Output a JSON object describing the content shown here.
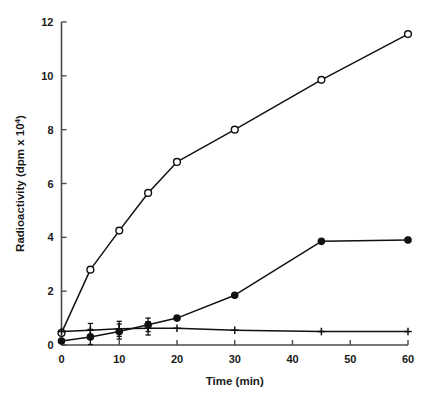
{
  "chart_data": {
    "type": "line",
    "title": "",
    "xlabel": "Time (min)",
    "ylabel": "Radioactivity (dpm x 10",
    "ylabel_exponent": "4",
    "ylabel_suffix": ")",
    "xlim": [
      0,
      60
    ],
    "ylim": [
      0,
      12
    ],
    "xticks": [
      0,
      10,
      20,
      30,
      40,
      50,
      60
    ],
    "xtick_labels": [
      "0",
      "10",
      "20",
      "30",
      "40",
      "50",
      "60"
    ],
    "yticks": [
      0,
      2,
      4,
      6,
      8,
      10,
      12
    ],
    "ytick_labels": [
      "0",
      "2",
      "4",
      "6",
      "8",
      "10",
      "12"
    ],
    "grid": false,
    "legend": "none",
    "x": [
      0,
      5,
      10,
      15,
      20,
      30,
      45,
      60
    ],
    "series": [
      {
        "name": "open-circle-series",
        "marker": "open-circle",
        "color": "#111111",
        "values": [
          0.45,
          2.8,
          4.25,
          5.65,
          6.8,
          8.0,
          9.85,
          11.55
        ]
      },
      {
        "name": "filled-circle-series",
        "marker": "filled-circle",
        "color": "#111111",
        "values": [
          0.15,
          0.3,
          0.5,
          0.75,
          1.0,
          1.85,
          3.85,
          3.9
        ]
      },
      {
        "name": "plus-series",
        "marker": "plus",
        "color": "#111111",
        "values": [
          0.5,
          0.55,
          0.6,
          0.62,
          0.62,
          0.55,
          0.5,
          0.5
        ]
      }
    ],
    "error_bars": [
      {
        "series": "filled-circle-series",
        "x": 5,
        "y": 0.3,
        "err": 0.28
      },
      {
        "series": "filled-circle-series",
        "x": 10,
        "y": 0.5,
        "err": 0.28
      },
      {
        "series": "filled-circle-series",
        "x": 15,
        "y": 0.75,
        "err": 0.25
      },
      {
        "series": "plus-series",
        "x": 5,
        "y": 0.55,
        "err": 0.25
      },
      {
        "series": "plus-series",
        "x": 10,
        "y": 0.6,
        "err": 0.28
      },
      {
        "series": "plus-series",
        "x": 15,
        "y": 0.62,
        "err": 0.25
      }
    ]
  }
}
